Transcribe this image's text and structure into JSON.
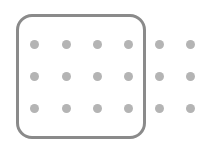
{
  "grid": {
    "rows": 3,
    "columns": 6,
    "selected_columns": 4,
    "dot_color": "#b4b4b4",
    "frame_color": "#8a8a8a",
    "column_x": [
      34,
      66,
      97,
      128,
      159,
      190
    ],
    "row_y": [
      44,
      76,
      108
    ]
  }
}
